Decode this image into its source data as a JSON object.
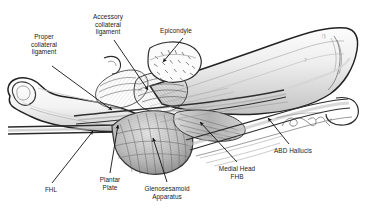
{
  "figure": {
    "type": "anatomical-pencil-illustration",
    "background_color": "#ffffff",
    "ink_color": "#1a1a1a",
    "pencil_tone": "#8c8c8c",
    "signature": "Eaxilian 96"
  },
  "labels": [
    {
      "id": "proper-collateral-ligament",
      "text": "Proper\ncollateral\nligament",
      "x": 16,
      "y": 33,
      "w": 56
    },
    {
      "id": "accessory-collateral-ligament",
      "text": "Accessory\ncollateral\nligament",
      "x": 79,
      "y": 13,
      "w": 58
    },
    {
      "id": "epicondyle",
      "text": "Epicondyle",
      "x": 148,
      "y": 27,
      "w": 56
    },
    {
      "id": "fhl",
      "text": "FHL",
      "x": 36,
      "y": 186,
      "w": 30
    },
    {
      "id": "plantar-plate",
      "text": "Plantar\nPlate",
      "x": 88,
      "y": 176,
      "w": 44
    },
    {
      "id": "glenosesamoid-apparatus",
      "text": "Glenosesamoid\nApparatus",
      "x": 131,
      "y": 185,
      "w": 72
    },
    {
      "id": "medial-head-fhb",
      "text": "Medial Head\nFHB",
      "x": 207,
      "y": 165,
      "w": 60
    },
    {
      "id": "abd-hallucis",
      "text": "ABD Hallucis",
      "x": 265,
      "y": 147,
      "w": 56
    }
  ],
  "leader_lines": [
    {
      "id": "leader-proper-collateral-ligament",
      "from": [
        52,
        66
      ],
      "to": [
        112,
        110
      ]
    },
    {
      "id": "leader-accessory-collateral-ligament",
      "from": [
        114,
        40
      ],
      "to": [
        148,
        90
      ]
    },
    {
      "id": "leader-epicondyle",
      "from": [
        183,
        38
      ],
      "to": [
        163,
        62
      ]
    },
    {
      "id": "leader-fhl",
      "from": [
        52,
        183
      ],
      "to": [
        93,
        131
      ]
    },
    {
      "id": "leader-plantar-plate",
      "from": [
        110,
        173
      ],
      "to": [
        118,
        125
      ]
    },
    {
      "id": "leader-glenosesamoid-apparatus",
      "from": [
        167,
        182
      ],
      "to": [
        153,
        138
      ]
    },
    {
      "id": "leader-medial-head-fhb",
      "from": [
        237,
        162
      ],
      "to": [
        200,
        122
      ]
    },
    {
      "id": "leader-abd-hallucis",
      "from": [
        289,
        144
      ],
      "to": [
        268,
        118
      ]
    }
  ]
}
